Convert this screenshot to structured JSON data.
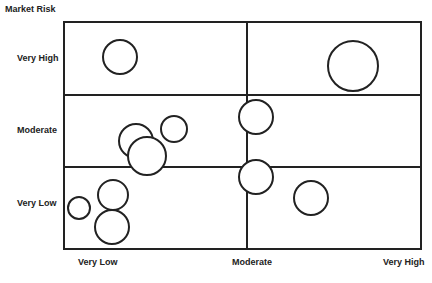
{
  "chart_data": {
    "type": "bubble-matrix",
    "title": "",
    "ylabel": "Market Risk",
    "xlabel": "",
    "y_categories": [
      "Very Low",
      "Moderate",
      "Very High"
    ],
    "x_categories": [
      "Very Low",
      "Moderate",
      "Very High"
    ],
    "grid": {
      "rows": 3,
      "cols": 2
    },
    "bubbles": [
      {
        "cx": 120,
        "cy": 57,
        "r": 17
      },
      {
        "cx": 353,
        "cy": 66,
        "r": 25
      },
      {
        "cx": 136,
        "cy": 141,
        "r": 17
      },
      {
        "cx": 147,
        "cy": 156,
        "r": 19
      },
      {
        "cx": 174,
        "cy": 129,
        "r": 13
      },
      {
        "cx": 256,
        "cy": 117,
        "r": 17
      },
      {
        "cx": 256,
        "cy": 177,
        "r": 17
      },
      {
        "cx": 79,
        "cy": 208,
        "r": 11
      },
      {
        "cx": 113,
        "cy": 195,
        "r": 15
      },
      {
        "cx": 112,
        "cy": 227,
        "r": 17
      },
      {
        "cx": 311,
        "cy": 198,
        "r": 17
      }
    ]
  },
  "labels": {
    "y_title": "Market Risk",
    "y_very_high": "Very High",
    "y_moderate": "Moderate",
    "y_very_low": "Very Low",
    "x_very_low": "Very Low",
    "x_moderate": "Moderate",
    "x_very_high": "Very High"
  },
  "colors": {
    "line": "#222222",
    "fill": "#ffffff"
  }
}
